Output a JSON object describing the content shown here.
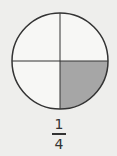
{
  "diagram": {
    "type": "fraction-circle",
    "parts": 4,
    "shaded_parts": 1,
    "shaded_quadrant": "bottom-right",
    "colors": {
      "background": "#eeeeec",
      "outline": "#333333",
      "shaded": "#a6a6a6",
      "unshaded": "#f7f7f5"
    }
  },
  "fraction": {
    "numerator": "1",
    "denominator": "4"
  }
}
